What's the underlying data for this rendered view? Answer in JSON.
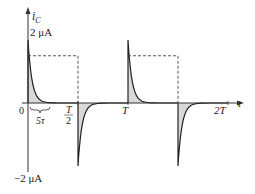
{
  "chart_data": {
    "type": "line",
    "title": "",
    "ylabel": "i",
    "ylabel_sub": "C",
    "xlabel": "t",
    "y_ticks": [
      {
        "value": 2,
        "label": "2 μA"
      },
      {
        "value": -2,
        "label": "−2 μA"
      }
    ],
    "x_ticks": [
      {
        "value": 0,
        "label": "0"
      },
      {
        "value": 0.5,
        "label_num": "T",
        "label_den": "2"
      },
      {
        "value": 1,
        "label": "T"
      },
      {
        "value": 2,
        "label": "2T"
      }
    ],
    "brace_label": "5τ",
    "brace_span": [
      0,
      0.2
    ],
    "ylim": [
      -2.2,
      2.6
    ],
    "xlim": [
      0,
      2.15
    ],
    "tau_fraction": 0.04,
    "square_wave_level": 1.5,
    "pulses": [
      {
        "start": 0,
        "sign": 1
      },
      {
        "start": 0.5,
        "sign": -1
      },
      {
        "start": 1,
        "sign": 1
      },
      {
        "start": 1.5,
        "sign": -1
      }
    ],
    "peak": 2,
    "series": [
      {
        "name": "capacitor current i_C",
        "style": "solid",
        "description": "exponential decaying spikes at each switching instant"
      },
      {
        "name": "square wave input",
        "style": "dashed"
      }
    ]
  }
}
